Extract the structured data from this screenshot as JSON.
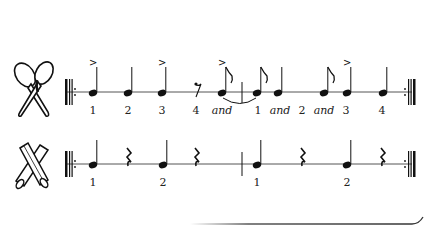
{
  "score": {
    "instruments": [
      {
        "name": "maracas",
        "icon": "maracas-icon",
        "staff_y": 92,
        "count_labels": [
          "1",
          "2",
          "3",
          "4",
          "and",
          "1",
          "and",
          "2",
          "and",
          "3",
          "4"
        ],
        "notes": [
          {
            "type": "quarter",
            "x": 93,
            "accent": true,
            "count": "1"
          },
          {
            "type": "quarter",
            "x": 128,
            "accent": false,
            "count": "2"
          },
          {
            "type": "quarter",
            "x": 162,
            "accent": true,
            "count": "3"
          },
          {
            "type": "eighth-rest",
            "x": 195,
            "count": "4"
          },
          {
            "type": "eighth",
            "x": 222,
            "accent": true,
            "count": "and",
            "tie_to_next": true
          },
          {
            "type": "barline",
            "x": 242
          },
          {
            "type": "eighth",
            "x": 257,
            "accent": false,
            "count": "1"
          },
          {
            "type": "quarter",
            "x": 278,
            "accent": false,
            "count": "and"
          },
          {
            "type": "label-only",
            "x": 302,
            "count": "2"
          },
          {
            "type": "eighth",
            "x": 324,
            "accent": false,
            "count": "and"
          },
          {
            "type": "quarter",
            "x": 347,
            "accent": true,
            "count": "3"
          },
          {
            "type": "quarter",
            "x": 383,
            "accent": false,
            "count": "4"
          }
        ]
      },
      {
        "name": "claves",
        "icon": "claves-icon",
        "staff_y": 164,
        "count_labels": [
          "1",
          "2",
          "1",
          "2"
        ],
        "notes": [
          {
            "type": "quarter",
            "x": 93,
            "count": "1"
          },
          {
            "type": "quarter-rest",
            "x": 128
          },
          {
            "type": "quarter",
            "x": 163,
            "count": "2"
          },
          {
            "type": "quarter-rest",
            "x": 196
          },
          {
            "type": "barline",
            "x": 242
          },
          {
            "type": "quarter",
            "x": 257,
            "count": "1"
          },
          {
            "type": "quarter-rest",
            "x": 302
          },
          {
            "type": "quarter",
            "x": 347,
            "count": "2"
          },
          {
            "type": "quarter-rest",
            "x": 382
          }
        ]
      }
    ],
    "labels": {
      "m1": "1",
      "m2": "2",
      "m3": "3",
      "m4": "4",
      "m5": "and",
      "m6": "1",
      "m7": "and",
      "m8": "2",
      "m9": "and",
      "m10": "3",
      "m11": "4",
      "c1": "1",
      "c2": "2",
      "c3": "1",
      "c4": "2"
    },
    "colors": {
      "ink": "#1a1a1a",
      "staff": "#555555",
      "background": "#ffffff"
    }
  }
}
